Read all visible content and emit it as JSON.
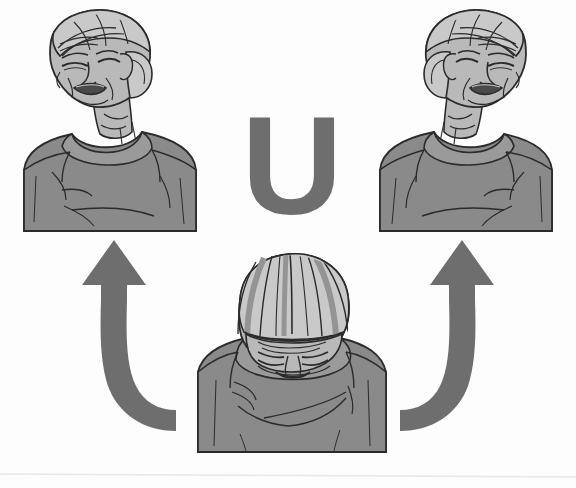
{
  "illustration": {
    "title": "Neck stretch exercise sequence",
    "letter_overlay": "U",
    "description": "Line-drawing illustration of an older woman performing a U-shaped neck roll: head dropped forward in the center, then rolled up to the left and up to the right.",
    "background_color": "#fdfdfd",
    "palette": {
      "ink": "#2b2b2b",
      "skin": "#b9b9b9",
      "skin_shadow": "#9d9d9d",
      "hair_light": "#c9c9c9",
      "hair_dark": "#949494",
      "shirt_body": "#8a8a8a",
      "shirt_sleeve": "#b2b2b2",
      "shirt_collar": "#9a9a9a",
      "arrow": "#6e6e6e",
      "letter": "#6e6e6e",
      "scan_line": "#e8e8e8"
    },
    "panels": [
      {
        "id": "top-left",
        "name": "head-rolled-left",
        "label": "Head rolled up and to the left, eyes closed, mouth open",
        "position": {
          "x": 20,
          "y": 8,
          "width": 196,
          "height": 226
        }
      },
      {
        "id": "top-right",
        "name": "head-rolled-right",
        "label": "Head rolled up and to the right, eyes closed, mouth open",
        "position": {
          "x": 362,
          "y": 8,
          "width": 196,
          "height": 226
        }
      },
      {
        "id": "bottom-center",
        "name": "head-bowed-forward",
        "label": "Head bowed forward, chin toward chest",
        "position": {
          "x": 196,
          "y": 256,
          "width": 190,
          "height": 196
        }
      }
    ],
    "arrows": [
      {
        "id": "arrow-left",
        "name": "curved-arrow-left",
        "label": "Curved arrow sweeping from center-bottom up to the left figure",
        "direction": "up-left",
        "color": "#6e6e6e"
      },
      {
        "id": "arrow-right",
        "name": "curved-arrow-right",
        "label": "Curved arrow sweeping from center-bottom up to the right figure",
        "direction": "up-right",
        "color": "#6e6e6e"
      }
    ]
  }
}
